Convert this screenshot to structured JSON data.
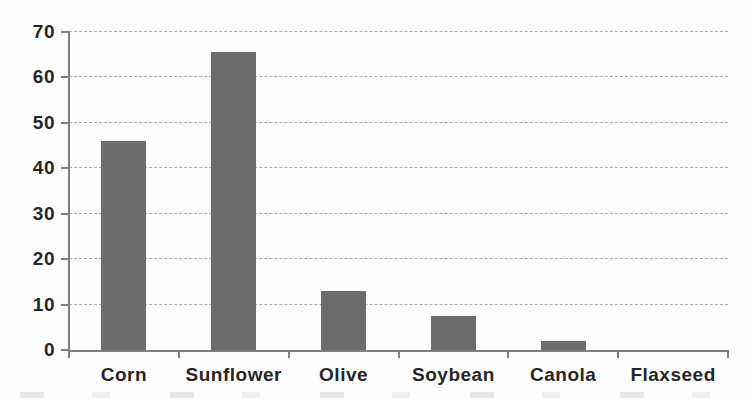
{
  "chart_data": {
    "type": "bar",
    "categories": [
      "Corn",
      "Sunflower",
      "Olive",
      "Soybean",
      "Canola",
      "Flaxseed"
    ],
    "values": [
      46,
      65.5,
      13,
      7.5,
      2,
      0
    ],
    "yticks": [
      0,
      10,
      20,
      30,
      40,
      50,
      60,
      70
    ],
    "ylim": [
      0,
      70
    ],
    "grid": true,
    "legend": false,
    "bar_color": "#6c6c6c",
    "gridline_color": "#ababab",
    "axis_color": "#7f7f7f",
    "label_color": "#262626",
    "background": "#fefefe"
  }
}
